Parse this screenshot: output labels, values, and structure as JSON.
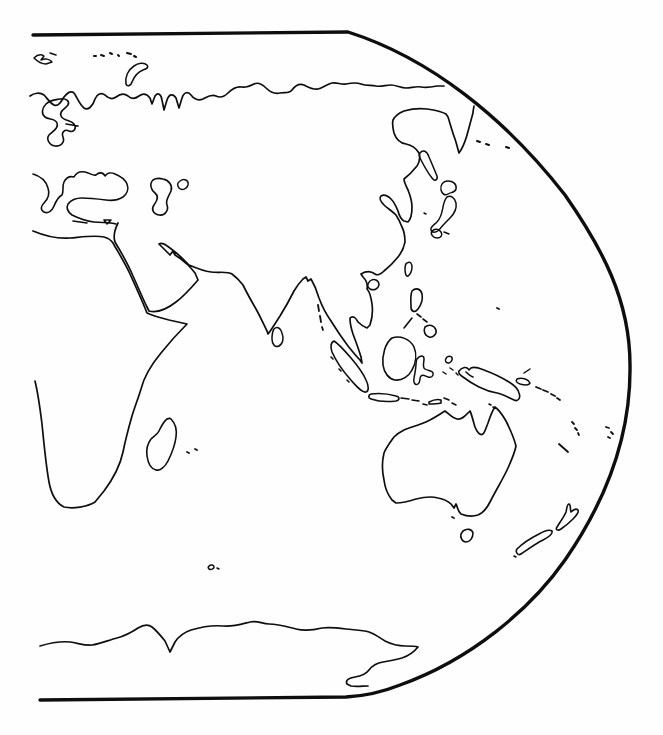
{
  "meta": {
    "style": "black ink coastline drawing on white paper, no labels or text"
  },
  "canvas": {
    "width": 663,
    "height": 735,
    "background": "#fefefe",
    "ink": "#0e0e0e"
  },
  "map": {
    "projection": "pseudocylindrical world-map right half: straight top and bottom borders joined by a large convex right-edge curve; left edge cropped with no border",
    "features": [
      {
        "name": "map-frame-border",
        "sw": 3.4,
        "d": "M 33 35 L 348 32 C 430 58 505 118 565 195 C 602 248 630 300 630 365 C 631 430 610 495 565 560 C 530 610 470 660 400 685 C 385 691 365 696 346 697 L 40 700"
      },
      {
        "name": "coastline-siberia-arctic",
        "sw": 1.7,
        "d": "M 30 96 C 34 93 40 92 44 95 C 47 98 50 103 54 105 C 58 107 61 102 64 97 C 67 93 71 90 74 93 C 77 97 79 104 84 108 C 88 111 93 106 95 99 C 97 94 101 92 105 95 C 108 98 112 100 116 97 C 120 94 124 93 128 96 C 131 99 135 99 139 96 C 143 93 147 94 150 98 L 152 104 L 155 96 C 158 92 161 94 162 100 L 164 110 L 167 100 C 169 94 173 93 176 98 L 179 108 L 182 98 C 184 92 188 91 191 95 C 194 99 198 101 203 99 C 207 97 211 94 216 96 C 220 98 224 97 228 93 C 232 89 237 86 242 87 C 246 88 250 86 254 84 C 258 82 262 84 266 88 C 270 92 275 94 280 93 C 285 92 289 94 292 90 C 295 86 299 83 304 85 C 308 87 313 90 318 89 C 323 88 327 84 332 83 C 337 82 341 85 346 84 C 351 83 356 82 361 84 C 366 86 371 85 376 86 C 381 87 386 85 391 85 C 396 85 401 88 406 88 C 411 88 416 86 421 87 C 426 88 432 87 437 86 L 444 86"
      },
      {
        "name": "coastline-scandinavia-baltic",
        "sw": 1.6,
        "d": "M 46 104 C 42 108 41 114 45 117 C 49 120 55 118 57 123 C 59 128 53 131 49 135 C 46 139 49 145 55 146 C 61 147 65 142 63 137 C 61 132 65 129 69 131 C 74 133 77 128 74 124 C 71 120 63 121 61 116 C 59 111 65 109 68 105 C 70 101 66 98 60 99 C 54 100 50 100 46 104 Z M 66 124 L 78 126"
      },
      {
        "name": "islands-svalbard",
        "sw": 1.5,
        "d": "M 34 58 C 37 55 41 54 44 56 L 41 60 C 45 58 50 59 52 62 L 46 64 C 42 64 38 62 34 58 Z M 50 53 L 56 55"
      },
      {
        "name": "islands-franz-josef-dots",
        "sw": 2.0,
        "d": "M 94 56 l 2 0 M 101 55 l 3 1 M 110 53 l 2 1 M 118 55 l 1 1 M 127 53 l 4 1 M 134 56 l 2 1"
      },
      {
        "name": "island-novaya-zemlya",
        "sw": 1.6,
        "d": "M 126 84 C 125 77 128 70 134 66 C 138 63 144 62 147 65 C 149 67 147 69 143 70 C 138 72 134 77 132 82 C 131 86 127 87 126 84 Z"
      },
      {
        "name": "coastline-black-sea-aegean",
        "sw": 1.6,
        "d": "M 33 174 C 40 176 46 181 48 188 C 50 194 48 199 44 203 C 41 206 40 210 44 212 C 48 214 52 211 54 206 C 56 201 58 197 62 195 C 64 191 62 186 64 182 C 66 178 70 176 74 177 C 76 173 80 171 85 172 C 90 173 93 176 96 175 C 99 172 103 172 105 176 C 107 173 111 172 115 174 C 120 176 125 179 127 184 C 129 189 127 194 123 197 C 118 200 112 201 106 200 C 98 199 90 198 82 198 C 76 198 71 200 68 204 C 66 208 68 212 72 215 C 78 218 86 221 94 222 C 102 223 110 222 116 224 M 73 221 L 87 223 M 104 220 L 111 220 L 107 224 Z"
      },
      {
        "name": "lake-caspian-sea",
        "sw": 1.6,
        "d": "M 153 180 C 149 184 151 190 155 193 C 159 196 157 201 154 205 C 151 209 153 214 159 215 C 165 216 169 210 167 205 C 165 200 169 196 171 191 C 173 186 169 180 163 179 C 159 178 156 178 153 180 Z"
      },
      {
        "name": "lake-aral-sea",
        "sw": 1.5,
        "d": "M 180 181 C 184 178 189 180 188 185 C 187 189 182 191 179 188 C 177 185 177 183 180 181 Z"
      },
      {
        "name": "coastline-africa",
        "sw": 1.7,
        "d": "M 33 231 C 45 236 58 239 70 238 C 82 237 95 235 104 237 C 108 238 111 240 113 243 C 118 252 125 263 130 274 C 135 285 141 298 145 308 L 147 313 C 153 316 161 318 169 320 L 187 324 C 179 332 169 343 161 353 C 151 365 144 377 141 389 C 138 399 135 406 132 416 C 128 430 125 442 123 452 C 120 466 113 479 104 491 L 95 502 C 87 507 73 509 64 507 C 56 503 51 493 49 482 C 46 466 44 444 42 424 C 40 408 38 393 35 381"
      },
      {
        "name": "coastline-asia-south-arabia-india-china",
        "sw": 1.7,
        "d": "M 118 223 C 115 229 113 236 115 242 C 121 252 128 264 133 276 C 138 287 143 299 147 307 L 149 311 C 157 313 167 309 176 302 C 184 296 192 287 198 280 L 195 273 C 192 269 189 266 187 264 L 181 259 L 175 255 L 173 251 L 170 255 C 166 251 162 247 159 244 C 162 242 166 245 170 248 C 174 251 179 255 183 259 C 185 261 187 263 189 265 C 196 268 203 271 211 272 C 219 273 227 271 232 274 C 236 277 240 281 243 285 L 245 289 C 248 295 252 302 256 309 C 260 316 264 325 267 331 L 268 334 C 272 329 276 322 280 316 C 285 308 290 299 294 291 C 297 286 300 282 303 279 L 306 277 L 308 281 L 311 279 C 314 284 317 291 319 298 C 322 306 326 314 331 321 C 336 329 342 338 348 346 C 352 351 356 356 360 360 L 362 363 L 361 357 C 359 350 356 342 353 334 C 351 328 350 322 350 318 C 353 315 356 318 358 322 C 361 325 364 327 367 328 L 370 325 C 372 319 373 311 372 304 C 371 297 369 291 367 289 C 368 284 366 280 363 277 L 361 274 C 366 271 371 271 375 274 C 378 276 381 274 384 271 C 389 267 394 262 398 257 C 402 252 404 247 405 242 C 405 237 404 231 402 227 C 400 222 398 218 396 215 C 392 211 387 208 384 205 C 381 202 379 198 381 196 C 384 194 388 196 391 199 C 394 202 396 206 398 211 C 399 215 401 219 404 221 L 408 222 C 411 219 412 213 412 207 C 412 201 410 195 408 190 C 406 186 404 182 404 179 C 408 176 413 171 417 166 C 420 162 420 157 419 153 C 416 148 411 145 406 144 C 400 143 396 139 394 133 C 393 129 392 124 393 120 C 395 116 399 113 404 111 C 411 109 419 108 427 109 C 434 110 441 111 446 114 L 448 117 C 450 123 452 131 455 139 C 457 145 458 150 459 153 C 462 149 465 142 467 135 C 469 128 471 120 473 113 C 473 110 474 107 474 106"
      },
      {
        "name": "island-sakhalin",
        "sw": 1.5,
        "d": "M 420 153 C 423 149 427 151 429 157 C 432 164 435 171 437 176 C 438 180 435 182 432 178 C 428 173 423 164 420 158 C 419 155 419 154 420 153 Z"
      },
      {
        "name": "island-hokkaido",
        "sw": 1.5,
        "d": "M 441 190 C 440 185 443 181 448 181 C 453 181 457 184 456 189 C 455 193 451 192 448 194 C 445 196 442 194 441 190 Z"
      },
      {
        "name": "island-honshu-japan",
        "sw": 1.5,
        "d": "M 447 197 C 451 195 455 198 456 203 C 457 209 454 214 450 218 C 446 222 442 226 439 230 C 436 233 432 233 431 230 C 430 227 434 225 437 222 C 440 219 442 213 443 207 C 444 202 445 199 447 197 Z M 432 231 C 435 228 439 229 441 232 C 443 235 441 238 437 238 C 433 238 430 234 432 231 Z M 444 232 L 449 234 M 424 213 l 2 1"
      },
      {
        "name": "islands-kuril-aleutian-dots",
        "sw": 2.0,
        "d": "M 477 141 l 3 1 M 486 144 l 3 1 M 506 147 l 3 1"
      },
      {
        "name": "island-taiwan",
        "sw": 1.5,
        "d": "M 407 263 C 410 261 412 263 412 267 C 412 271 410 275 408 276 C 406 277 405 273 405 269 C 405 266 405 264 407 263 Z"
      },
      {
        "name": "island-hainan",
        "sw": 1.5,
        "d": "M 370 281 C 374 278 379 280 379 285 C 378 289 374 291 370 289 C 367 287 367 284 370 281 Z"
      },
      {
        "name": "island-sri-lanka",
        "sw": 1.5,
        "d": "M 274 329 C 277 326 281 328 282 333 C 284 338 283 344 279 346 C 275 348 272 344 272 339 C 272 335 272 332 274 329 Z"
      },
      {
        "name": "islands-andaman-nicobar",
        "sw": 1.8,
        "d": "M 318 305 l 1 6 M 320 316 l 1 6 M 322 327 l 1 3"
      },
      {
        "name": "island-sumatra",
        "sw": 1.6,
        "d": "M 334 341 C 339 344 345 351 351 358 C 357 365 363 373 366 380 C 369 386 369 391 366 392 C 362 393 356 386 350 379 C 343 371 336 361 332 352 C 330 347 331 342 334 341 Z M 331 357 l 2 2 M 339 369 l 2 2 M 347 380 l 2 2"
      },
      {
        "name": "islands-java-lesser-sunda-timor",
        "sw": 1.6,
        "d": "M 371 394 C 379 393 389 394 396 396 C 400 397 400 400 396 401 C 388 402 377 401 371 399 C 368 398 368 395 371 394 Z M 401 398 l 8 1 M 412 400 l 7 1 M 429 402 C 433 400 438 399 441 400 L 441 403 C 437 404 432 404 429 404 Z M 423 404 l 4 1"
      },
      {
        "name": "island-borneo",
        "sw": 1.6,
        "d": "M 392 338 C 400 335 410 339 414 347 C 417 354 416 363 412 370 C 409 376 402 381 395 380 C 389 379 384 373 383 365 C 382 356 385 343 392 338 Z"
      },
      {
        "name": "island-sulawesi",
        "sw": 1.5,
        "d": "M 417 359 C 420 355 424 355 424 359 C 424 363 422 367 425 369 C 428 371 432 370 433 373 C 434 376 431 378 428 377 C 425 376 423 374 421 376 C 419 378 421 382 418 384 C 415 386 413 382 414 378 C 415 373 416 368 416 364 C 416 362 416 361 417 359 Z"
      },
      {
        "name": "islands-moluccas-halmahera",
        "sw": 1.5,
        "d": "M 447 357 C 450 355 453 357 452 360 C 451 363 448 364 446 362 C 445 360 445 359 447 357 Z M 450 368 l 3 2 M 443 372 l 3 2 M 456 373 l 2 2"
      },
      {
        "name": "islands-philippines",
        "sw": 1.6,
        "d": "M 412 291 C 416 287 421 289 422 294 C 423 299 421 305 418 309 C 415 313 411 312 411 307 C 411 302 410 296 412 291 Z M 417 314 l 4 3 M 423 319 l 4 3 M 425 327 C 429 324 434 325 436 330 C 437 334 433 338 429 337 C 425 336 423 331 425 327 Z M 412 318 L 404 328"
      },
      {
        "name": "island-new-guinea",
        "sw": 1.6,
        "d": "M 459 371 C 462 367 467 366 469 370 L 471 368 C 475 366 479 368 484 370 C 492 373 501 377 509 382 C 514 385 518 389 519 393 C 521 398 518 402 514 400 C 509 398 503 394 497 393 C 491 392 485 390 479 387 C 473 384 467 380 463 377 C 460 375 458 373 459 371 Z M 466 372 C 468 374 470 376 473 377"
      },
      {
        "name": "islands-bismarck-new-britain",
        "sw": 1.5,
        "d": "M 517 379 C 522 377 528 379 530 383 C 529 386 524 385 520 384 C 517 383 515 381 517 379 Z M 524 373 L 530 369"
      },
      {
        "name": "islands-solomon-chain",
        "sw": 1.8,
        "d": "M 536 387 l 5 2 M 543 390 l 5 2 M 551 394 l 4 2 M 557 398 l 3 2"
      },
      {
        "name": "islands-vanuatu-dots",
        "sw": 1.8,
        "d": "M 572 422 l 2 2 M 575 428 l 2 2 M 578 433 l 1 2"
      },
      {
        "name": "island-new-caledonia",
        "sw": 1.8,
        "d": "M 559 444 L 568 452"
      },
      {
        "name": "islands-fiji-dots",
        "sw": 1.8,
        "d": "M 606 427 l 3 1 M 611 432 l 2 2 M 608 437 l 2 1"
      },
      {
        "name": "island-palau-dot",
        "sw": 1.8,
        "d": "M 497 308 l 2 1"
      },
      {
        "name": "coastline-australia",
        "sw": 1.7,
        "d": "M 495 407 C 492 411 490 417 488 423 C 486 428 485 432 483 434 C 480 436 477 432 475 427 C 473 421 472 415 470 411 C 466 415 462 420 457 419 C 452 418 448 413 445 411 C 440 414 434 418 428 421 C 420 425 411 427 404 430 C 400 432 397 434 394 437 C 389 444 386 448 384 453 C 382 461 382 471 384 480 C 385 488 388 495 392 500 L 396 503 C 403 503 410 501 416 499 C 424 497 431 496 438 498 C 443 499 448 501 451 504 L 454 508 L 456 504 C 458 508 458 512 461 514 C 466 516 472 517 478 515 C 483 513 487 508 490 502 C 496 490 503 479 508 468 C 512 459 515 452 516 446 C 514 438 510 429 506 421 C 502 414 499 410 495 407 Z M 452 517 l 2 1"
      },
      {
        "name": "island-tasmania",
        "sw": 1.6,
        "d": "M 463 531 C 467 528 472 529 473 533 C 473 538 470 542 466 542 C 462 542 460 537 461 534 Z"
      },
      {
        "name": "islands-new-zealand",
        "sw": 1.6,
        "d": "M 517 549 C 523 543 531 538 539 534 C 544 531 549 529 552 531 C 553 534 549 537 543 540 C 535 544 527 550 521 554 C 518 556 515 552 517 549 Z M 557 527 C 560 522 564 517 566 512 C 567 508 567 504 569 504 C 571 505 570 509 571 512 C 573 510 576 508 578 510 C 579 512 576 516 573 519 C 569 523 564 527 561 529 C 558 531 555 530 557 527 Z M 514 556 l 2 1"
      },
      {
        "name": "coastline-antarctica",
        "sw": 1.7,
        "d": "M 40 646 C 50 643 60 641 70 642 C 78 643 85 646 92 645 C 100 644 109 640 117 638 C 125 636 132 632 138 628 C 143 625 148 624 152 627 C 157 631 161 636 165 641 L 170 652 L 175 642 C 179 636 185 632 191 630 C 201 627 212 625 223 626 C 233 627 242 624 250 622 C 257 620 262 624 269 624 C 278 624 288 627 296 629 C 304 631 314 630 322 628 C 330 627 338 628 346 629 C 354 630 362 630 369 632 C 375 634 380 638 385 641 C 391 644 398 646 405 646 C 410 646 415 646 418 647 C 414 652 408 656 402 658 C 395 660 389 661 383 662 C 377 663 372 666 369 670 C 366 674 361 676 355 677 C 349 678 345 680 347 684 L 351 686 C 357 687 363 686 368 686"
      },
      {
        "name": "island-kerguelen",
        "sw": 1.5,
        "d": "M 209 566 C 211 564 214 565 214 567 C 214 569 211 570 209 569 C 208 568 208 567 209 566 Z M 217 568 l 2 1"
      },
      {
        "name": "islands-mauritius-reunion-dots",
        "sw": 1.8,
        "d": "M 187 452 l 2 1 M 195 449 l 2 1"
      },
      {
        "name": "island-madagascar",
        "sw": 1.6,
        "d": "M 171 419 C 175 423 177 430 176 437 C 175 445 172 453 168 461 C 165 467 160 471 156 470 C 151 469 148 463 147 456 C 146 449 148 443 151 439 C 154 436 157 435 159 431 C 161 427 163 422 167 419 C 169 418 170 418 171 419 Z"
      },
      {
        "name": "islands-torres-strait-dots",
        "sw": 1.6,
        "d": "M 489 404 l 2 1 M 493 407 l 2 1"
      },
      {
        "name": "islands-arafura-dashes",
        "sw": 1.6,
        "d": "M 444 398 l 5 2 M 452 403 l 4 2"
      }
    ]
  }
}
